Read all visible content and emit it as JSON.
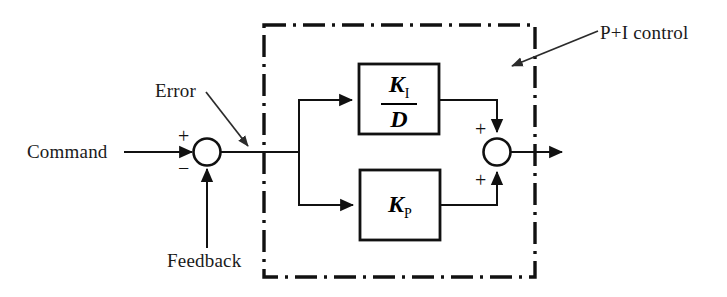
{
  "diagram": {
    "stroke_color": "#111111",
    "background_color": "#ffffff",
    "labels": {
      "command": "Command",
      "error": "Error",
      "feedback": "Feedback",
      "annotation": "P+I control"
    },
    "summing_junction_input": {
      "name": "input-summing-junction",
      "sign_top": "+",
      "sign_bottom": "−"
    },
    "summing_junction_output": {
      "name": "output-summing-junction",
      "sign_top": "+",
      "sign_bottom": "+"
    },
    "blocks": [
      {
        "id": "integral-block",
        "kind": "fraction",
        "numerator": "K",
        "numerator_subscript": "I",
        "denominator": "D",
        "denominator_subscript": "",
        "text": "K_I / D"
      },
      {
        "id": "proportional-block",
        "kind": "gain",
        "symbol": "K",
        "subscript": "P",
        "text": "K_P"
      }
    ],
    "boundary": {
      "name": "pi-control-boundary",
      "style": "dash-dot",
      "encloses": [
        "integral-block",
        "proportional-block",
        "output-summing-junction"
      ]
    }
  }
}
